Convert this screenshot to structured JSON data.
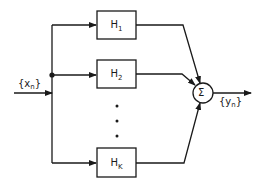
{
  "diagram": {
    "type": "block-diagram",
    "input": {
      "label": "{x",
      "sub": "n",
      "close": "}"
    },
    "output": {
      "label": "{y",
      "sub": "n",
      "close": "}"
    },
    "filters": [
      {
        "label": "H",
        "sub": "1"
      },
      {
        "label": "H",
        "sub": "2"
      },
      {
        "label": "H",
        "sub": "K"
      }
    ],
    "ellipsis": "⋮",
    "summer": {
      "symbol": "Σ"
    },
    "colors": {
      "stroke": "#1a1a1a",
      "background": "#ffffff"
    }
  }
}
